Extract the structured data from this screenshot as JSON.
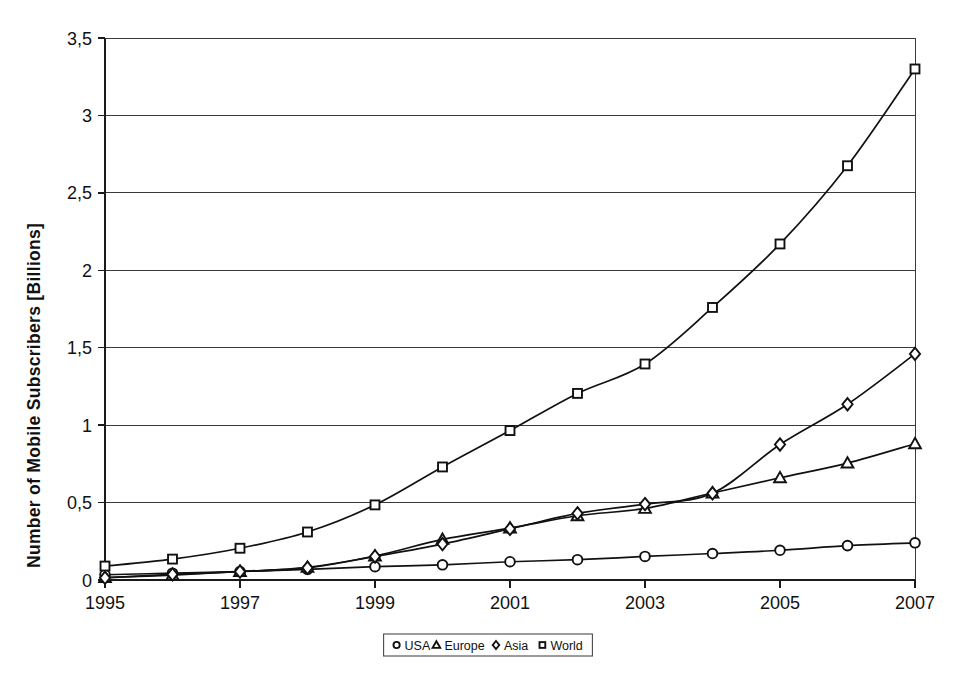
{
  "chart_data": {
    "type": "line",
    "title": "",
    "xlabel": "",
    "ylabel": "Number of Mobile Subscribers [Billions]",
    "x": [
      1995,
      1996,
      1997,
      1998,
      1999,
      2000,
      2001,
      2002,
      2003,
      2004,
      2005,
      2006,
      2007
    ],
    "xlim": [
      1995,
      2007
    ],
    "ylim": [
      0,
      3.5
    ],
    "grid": true,
    "legend_position": "bottom-center",
    "xtick_labels": [
      "1995",
      "1997",
      "1999",
      "2001",
      "2003",
      "2005",
      "2007"
    ],
    "xtick_values": [
      1995,
      1997,
      1999,
      2001,
      2003,
      2005,
      2007
    ],
    "ytick_labels": [
      "0",
      "0,5",
      "1",
      "1,5",
      "2",
      "2,5",
      "3",
      "3,5"
    ],
    "ytick_values": [
      0,
      0.5,
      1,
      1.5,
      2,
      2.5,
      3,
      3.5
    ],
    "series": [
      {
        "name": "USA",
        "marker": "circle",
        "values": [
          0.034,
          0.044,
          0.055,
          0.069,
          0.086,
          0.098,
          0.118,
          0.131,
          0.152,
          0.171,
          0.192,
          0.222,
          0.24
        ]
      },
      {
        "name": "Europe",
        "marker": "triangle",
        "values": [
          0.016,
          0.032,
          0.055,
          0.082,
          0.155,
          0.262,
          0.335,
          0.415,
          0.462,
          0.562,
          0.66,
          0.755,
          0.88
        ]
      },
      {
        "name": "Asia",
        "marker": "diamond",
        "values": [
          0.014,
          0.036,
          0.054,
          0.078,
          0.152,
          0.232,
          0.33,
          0.43,
          0.49,
          0.56,
          0.875,
          1.135,
          1.46
        ]
      },
      {
        "name": "World",
        "marker": "square",
        "values": [
          0.09,
          0.135,
          0.205,
          0.31,
          0.485,
          0.73,
          0.965,
          1.205,
          1.395,
          1.76,
          2.17,
          2.675,
          3.3
        ]
      }
    ]
  },
  "legend": {
    "entries": [
      {
        "label": "USA",
        "marker": "circle"
      },
      {
        "label": "Europe",
        "marker": "triangle"
      },
      {
        "label": "Asia",
        "marker": "diamond"
      },
      {
        "label": "World",
        "marker": "square"
      }
    ]
  },
  "colors": {
    "line": "#111111",
    "marker_fill": "#ffffff",
    "grid": "#3a3a3a",
    "background": "#ffffff",
    "text": "#111111"
  }
}
